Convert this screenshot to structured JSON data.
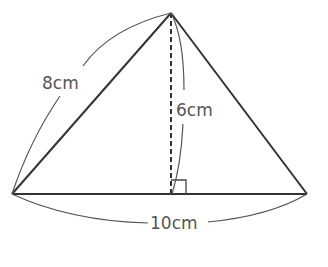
{
  "diagram": {
    "type": "triangle",
    "labels": {
      "left_side": "8cm",
      "height": "6cm",
      "base": "10cm"
    },
    "right_angle_marker": true,
    "colors": {
      "line": "#333333",
      "arc": "#555555",
      "text": "#555555"
    }
  }
}
